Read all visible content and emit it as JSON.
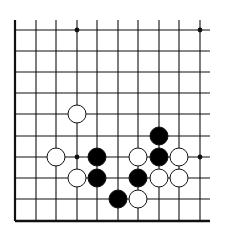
{
  "diagram": {
    "type": "go-board-fragment",
    "columns": 10,
    "rows": 10,
    "visible_edges": [
      "left",
      "bottom"
    ],
    "colors": {
      "line": "#111111",
      "black_stone": "#000000",
      "white_stone": "#ffffff",
      "background": "#ffffff"
    },
    "star_points": [
      {
        "col": 3,
        "row": 0
      },
      {
        "col": 9,
        "row": 0
      },
      {
        "col": 3,
        "row": 6
      },
      {
        "col": 9,
        "row": 6
      }
    ],
    "stones": [
      {
        "color": "white",
        "col": 3,
        "row": 4
      },
      {
        "color": "black",
        "col": 7,
        "row": 5
      },
      {
        "color": "white",
        "col": 2,
        "row": 6
      },
      {
        "color": "black",
        "col": 4,
        "row": 6
      },
      {
        "color": "white",
        "col": 6,
        "row": 6
      },
      {
        "color": "black",
        "col": 7,
        "row": 6
      },
      {
        "color": "white",
        "col": 8,
        "row": 6
      },
      {
        "color": "white",
        "col": 3,
        "row": 7
      },
      {
        "color": "black",
        "col": 4,
        "row": 7
      },
      {
        "color": "black",
        "col": 6,
        "row": 7
      },
      {
        "color": "white",
        "col": 7,
        "row": 7
      },
      {
        "color": "white",
        "col": 8,
        "row": 7
      },
      {
        "color": "black",
        "col": 5,
        "row": 8
      },
      {
        "color": "white",
        "col": 6,
        "row": 8
      }
    ]
  }
}
